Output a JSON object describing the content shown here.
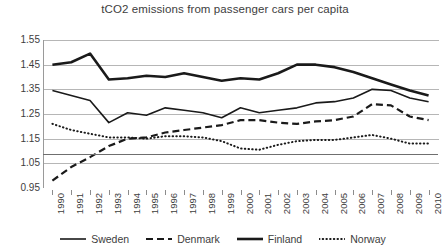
{
  "chart_data": {
    "type": "line",
    "title": "tCO2 emissions from passenger cars per capita",
    "xlabel": "",
    "ylabel": "",
    "ylim": [
      0.95,
      1.55
    ],
    "yticks": [
      "0.95",
      "1.05",
      "1.15",
      "1.25",
      "1.35",
      "1.45",
      "1.55"
    ],
    "grid": true,
    "legend_position": "bottom",
    "x": [
      1990,
      1991,
      1992,
      1993,
      1994,
      1995,
      1996,
      1997,
      1998,
      1999,
      2000,
      2001,
      2002,
      2003,
      2004,
      2005,
      2006,
      2007,
      2008,
      2009,
      2010
    ],
    "categories": [
      "1990",
      "1991",
      "1992",
      "1993",
      "1994",
      "1995",
      "1996",
      "1997",
      "1998",
      "1999",
      "2000",
      "2001",
      "2002",
      "2003",
      "2004",
      "2005",
      "2006",
      "2007",
      "2008",
      "2009",
      "2010"
    ],
    "series": [
      {
        "name": "Sweden",
        "style": "solid-thin",
        "color": "#1a1a1a",
        "values": [
          1.345,
          1.325,
          1.305,
          1.215,
          1.255,
          1.245,
          1.275,
          1.265,
          1.255,
          1.235,
          1.275,
          1.255,
          1.265,
          1.275,
          1.295,
          1.3,
          1.315,
          1.35,
          1.345,
          1.315,
          1.3
        ]
      },
      {
        "name": "Denmark",
        "style": "dashed",
        "color": "#1a1a1a",
        "values": [
          0.98,
          1.035,
          1.075,
          1.12,
          1.15,
          1.155,
          1.175,
          1.185,
          1.195,
          1.205,
          1.225,
          1.225,
          1.215,
          1.21,
          1.22,
          1.225,
          1.24,
          1.29,
          1.285,
          1.24,
          1.225
        ]
      },
      {
        "name": "Finland",
        "style": "solid-thick",
        "color": "#1a1a1a",
        "values": [
          1.45,
          1.46,
          1.495,
          1.39,
          1.395,
          1.405,
          1.4,
          1.415,
          1.4,
          1.385,
          1.395,
          1.39,
          1.415,
          1.45,
          1.45,
          1.44,
          1.42,
          1.395,
          1.37,
          1.345,
          1.325
        ]
      },
      {
        "name": "Norway",
        "style": "dotted",
        "color": "#1a1a1a",
        "values": [
          1.21,
          1.185,
          1.17,
          1.155,
          1.155,
          1.15,
          1.16,
          1.16,
          1.155,
          1.14,
          1.11,
          1.105,
          1.125,
          1.14,
          1.145,
          1.145,
          1.155,
          1.165,
          1.15,
          1.13,
          1.13
        ]
      }
    ]
  }
}
